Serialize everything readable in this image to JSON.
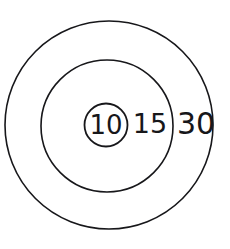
{
  "diagram": {
    "background_color": "#ffffff",
    "stroke_color": "#17171a",
    "canvas": {
      "width": 230,
      "height": 249
    },
    "rings": [
      {
        "label": "30",
        "name": "outer-ring",
        "cx": 109,
        "cy": 125,
        "r": 104,
        "stroke_width": 1.6,
        "label_x": 196,
        "label_y": 125,
        "label_size": 30
      },
      {
        "label": "15",
        "name": "middle-ring",
        "cx": 107,
        "cy": 126,
        "r": 66,
        "stroke_width": 1.6,
        "label_x": 150,
        "label_y": 125,
        "label_size": 27
      },
      {
        "label": "10",
        "name": "inner-ring",
        "cx": 106,
        "cy": 125,
        "r": 21.5,
        "stroke_width": 1.8,
        "label_x": 106,
        "label_y": 126,
        "label_size": 26
      }
    ]
  },
  "chart_data": {
    "type": "diagram",
    "categories": [
      "10",
      "15",
      "30"
    ],
    "values": [
      21.5,
      66,
      104
    ],
    "xlabel": "",
    "ylabel": "radius (px)"
  }
}
